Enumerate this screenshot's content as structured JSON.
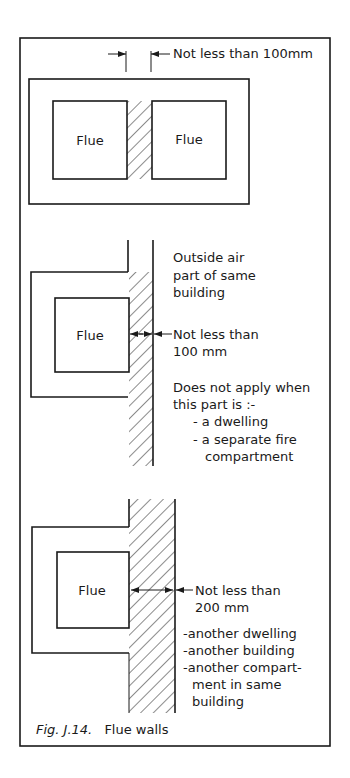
{
  "figure": {
    "caption_label": "Fig. J.14.",
    "caption_title": "Flue walls"
  },
  "panel_1": {
    "flue_left_label": "Flue",
    "flue_right_label": "Flue",
    "dimension_label": "Not less than 100mm"
  },
  "panel_2": {
    "flue_label": "Flue",
    "side_note_lines": [
      "Outside air",
      "part of same",
      "building"
    ],
    "dimension_lines": [
      "Not less than",
      "100 mm"
    ],
    "exception_lines": [
      "Does not apply when",
      "this part is :-"
    ],
    "exception_items": [
      "- a dwelling",
      "- a separate fire",
      "compartment"
    ]
  },
  "panel_3": {
    "flue_label": "Flue",
    "dimension_lines": [
      "Not less than",
      "200 mm"
    ],
    "applies_items": [
      "-another dwelling",
      "-another building",
      "-another compart-",
      "ment in same",
      "building"
    ]
  },
  "colors": {
    "ink": "#1a1a1a",
    "paper": "#ffffff"
  }
}
